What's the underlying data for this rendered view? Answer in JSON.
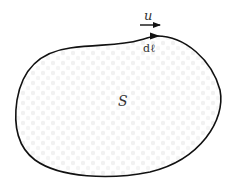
{
  "diagram": {
    "region_label": "S",
    "vector_label": "u",
    "element_label": "dℓ",
    "colors": {
      "curve": "#111111",
      "text": "#333333",
      "fill_dots": "#ececec",
      "background": "#ffffff"
    }
  }
}
